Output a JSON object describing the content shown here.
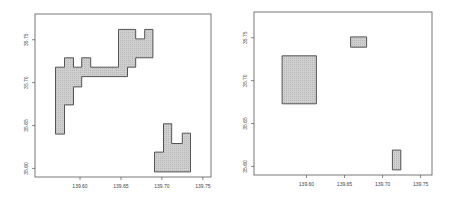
{
  "chart_data": [
    {
      "type": "map",
      "title": "",
      "xlabel": "",
      "ylabel": "",
      "xlim": [
        139.545,
        139.76
      ],
      "ylim": [
        35.59,
        35.78
      ],
      "xticks": [
        "139.60",
        "139.65",
        "139.70",
        "139.75"
      ],
      "xtick_values": [
        139.6,
        139.65,
        139.7,
        139.75
      ],
      "yticks": [
        "35.60",
        "35.65",
        "35.70",
        "35.75"
      ],
      "ytick_values": [
        35.6,
        35.65,
        35.7,
        35.75
      ],
      "fill_color": "#c8c8c8",
      "polygons": [
        {
          "name": "northwest-region",
          "coords": [
            [
              139.57,
              35.64
            ],
            [
              139.57,
              35.718
            ],
            [
              139.581,
              35.718
            ],
            [
              139.581,
              35.729
            ],
            [
              139.592,
              35.729
            ],
            [
              139.592,
              35.718
            ],
            [
              139.602,
              35.718
            ],
            [
              139.602,
              35.729
            ],
            [
              139.613,
              35.729
            ],
            [
              139.613,
              35.718
            ],
            [
              139.647,
              35.718
            ],
            [
              139.647,
              35.762
            ],
            [
              139.668,
              35.762
            ],
            [
              139.668,
              35.751
            ],
            [
              139.679,
              35.751
            ],
            [
              139.679,
              35.762
            ],
            [
              139.689,
              35.762
            ],
            [
              139.689,
              35.729
            ],
            [
              139.668,
              35.729
            ],
            [
              139.668,
              35.718
            ],
            [
              139.658,
              35.718
            ],
            [
              139.658,
              35.707
            ],
            [
              139.602,
              35.707
            ],
            [
              139.602,
              35.695
            ],
            [
              139.592,
              35.695
            ],
            [
              139.592,
              35.674
            ],
            [
              139.581,
              35.674
            ],
            [
              139.581,
              35.64
            ]
          ]
        },
        {
          "name": "southeast-region",
          "coords": [
            [
              139.691,
              35.596
            ],
            [
              139.691,
              35.619
            ],
            [
              139.702,
              35.619
            ],
            [
              139.702,
              35.652
            ],
            [
              139.712,
              35.652
            ],
            [
              139.712,
              35.629
            ],
            [
              139.725,
              35.629
            ],
            [
              139.725,
              35.641
            ],
            [
              139.735,
              35.641
            ],
            [
              139.735,
              35.596
            ]
          ]
        }
      ]
    },
    {
      "type": "map",
      "title": "",
      "xlabel": "",
      "ylabel": "",
      "xlim": [
        139.531,
        139.765
      ],
      "ylim": [
        35.59,
        35.78
      ],
      "xticks": [
        "139.60",
        "139.65",
        "139.70",
        "139.75"
      ],
      "xtick_values": [
        139.6,
        139.65,
        139.7,
        139.75
      ],
      "yticks": [
        "35.60",
        "35.65",
        "35.70",
        "35.75"
      ],
      "ytick_values": [
        35.6,
        35.65,
        35.7,
        35.75
      ],
      "fill_color": "#c8c8c8",
      "polygons": [
        {
          "name": "west-rectangle",
          "coords": [
            [
              139.568,
              35.673
            ],
            [
              139.568,
              35.729
            ],
            [
              139.613,
              35.729
            ],
            [
              139.613,
              35.673
            ]
          ]
        },
        {
          "name": "north-rectangle",
          "coords": [
            [
              139.658,
              35.739
            ],
            [
              139.658,
              35.751
            ],
            [
              139.679,
              35.751
            ],
            [
              139.679,
              35.739
            ]
          ]
        },
        {
          "name": "southeast-rectangle",
          "coords": [
            [
              139.713,
              35.596
            ],
            [
              139.713,
              35.619
            ],
            [
              139.724,
              35.619
            ],
            [
              139.724,
              35.596
            ]
          ]
        }
      ]
    }
  ]
}
